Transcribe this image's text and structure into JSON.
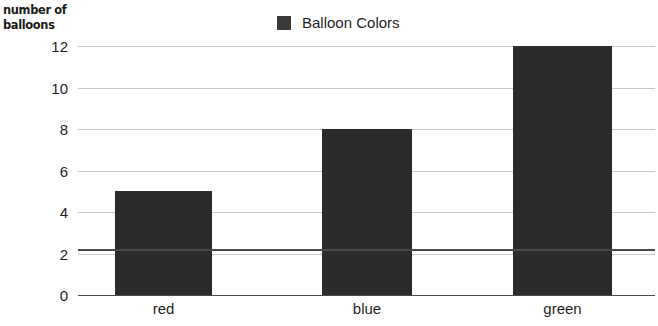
{
  "chart_data": {
    "type": "bar",
    "title": "",
    "categories": [
      "red",
      "blue",
      "green"
    ],
    "values": [
      5,
      8,
      12
    ],
    "series": [
      {
        "name": "Balloon Colors",
        "values": [
          5,
          8,
          12
        ]
      }
    ],
    "xlabel": "",
    "ylabel": "number of balloons",
    "ylabel_lines": [
      "number of",
      "balloons"
    ],
    "ylim": [
      0,
      12
    ],
    "ytick_step": 2,
    "yticks": [
      12,
      10,
      8,
      6,
      4,
      2,
      0
    ],
    "grid": true,
    "legend": {
      "position": "top-center",
      "entries": [
        {
          "label": "Balloon Colors",
          "color": "#3a3a3a"
        }
      ]
    },
    "bar_color": "#2b2b2b",
    "gridline_color": "#c8c8c8",
    "axis_color": "#4a4a4a",
    "background": "#ffffff"
  }
}
